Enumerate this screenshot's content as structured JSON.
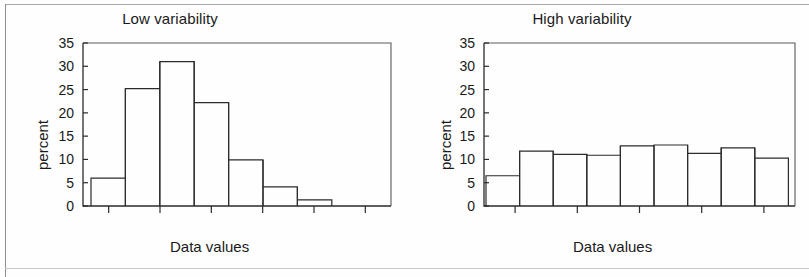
{
  "figure": {
    "panels": [
      {
        "name": "low-variability",
        "title": "Low variability",
        "xlabel": "Data values",
        "ylabel": "percent"
      },
      {
        "name": "high-variability",
        "title": "High variability",
        "xlabel": "Data values",
        "ylabel": "percent"
      }
    ]
  },
  "chart_data": [
    {
      "type": "bar",
      "title": "Low variability",
      "xlabel": "Data values",
      "ylabel": "percent",
      "ylim": [
        0,
        35
      ],
      "ytick_labels": [
        "0",
        "5",
        "10",
        "15",
        "20",
        "25",
        "30",
        "35"
      ],
      "ytick_values": [
        0,
        5,
        10,
        15,
        20,
        25,
        30,
        35
      ],
      "grid": false,
      "legend": null,
      "bin_count": 7,
      "x_tick_count": 6,
      "categories": [
        "bin1",
        "bin2",
        "bin3",
        "bin4",
        "bin5",
        "bin6",
        "bin7"
      ],
      "values": [
        6.0,
        25.2,
        31.0,
        22.2,
        9.9,
        4.1,
        1.3
      ]
    },
    {
      "type": "bar",
      "title": "High variability",
      "xlabel": "Data values",
      "ylabel": "percent",
      "ylim": [
        0,
        35
      ],
      "ytick_labels": [
        "0",
        "5",
        "10",
        "15",
        "20",
        "25",
        "30",
        "35"
      ],
      "ytick_values": [
        0,
        5,
        10,
        15,
        20,
        25,
        30,
        35
      ],
      "grid": false,
      "legend": null,
      "bin_count": 9,
      "x_tick_count": 5,
      "categories": [
        "bin1",
        "bin2",
        "bin3",
        "bin4",
        "bin5",
        "bin6",
        "bin7",
        "bin8",
        "bin9"
      ],
      "values": [
        6.5,
        11.8,
        11.1,
        10.9,
        12.9,
        13.1,
        11.3,
        12.5,
        10.3
      ]
    }
  ]
}
